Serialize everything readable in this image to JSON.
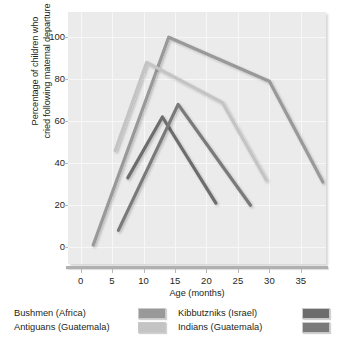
{
  "chart_data": {
    "type": "line",
    "title": "",
    "xlabel": "Age (months)",
    "ylabel": "Percentage of children who\ncried following maternal departure",
    "xlim": [
      -2,
      39
    ],
    "ylim": [
      -8,
      112
    ],
    "xticks": [
      0,
      5,
      10,
      15,
      20,
      25,
      30,
      35
    ],
    "yticks": [
      0,
      20,
      40,
      60,
      80,
      100
    ],
    "grid": true,
    "legend_position": "below",
    "series": [
      {
        "name": "Bushmen (Africa)",
        "color": "#999999",
        "x": [
          2,
          14,
          30,
          38.5
        ],
        "values": [
          1,
          100,
          79,
          31
        ]
      },
      {
        "name": "Antiguans (Guatemala)",
        "color": "#c4c4c4",
        "x": [
          5.5,
          10.5,
          22.5,
          29.5
        ],
        "values": [
          46,
          88,
          69,
          32
        ]
      },
      {
        "name": "Kibbutzniks (Israel)",
        "color": "#6d6d6d",
        "x": [
          7.5,
          13,
          21.5
        ],
        "values": [
          33,
          62,
          21
        ]
      },
      {
        "name": "Indians (Guatemala)",
        "color": "#7a7a7a",
        "x": [
          6,
          15.5,
          27
        ],
        "values": [
          8,
          68,
          20
        ]
      }
    ]
  },
  "legend": {
    "columns": [
      {
        "items": [
          {
            "label": "Bushmen (Africa)",
            "swatch": "#999999"
          },
          {
            "label": "Antiguans (Guatemala)",
            "swatch": "#c4c4c4"
          }
        ]
      },
      {
        "items": [
          {
            "label": "Kibbutzniks (Israel)",
            "swatch": "#6d6d6d"
          },
          {
            "label": "Indians (Guatemala)",
            "swatch": "#7a7a7a"
          }
        ]
      }
    ]
  },
  "colors": {
    "plot_background": "#ebebeb",
    "grid": "#f7f7f7",
    "axis": "#b0b0b0",
    "text": "#231f20"
  }
}
